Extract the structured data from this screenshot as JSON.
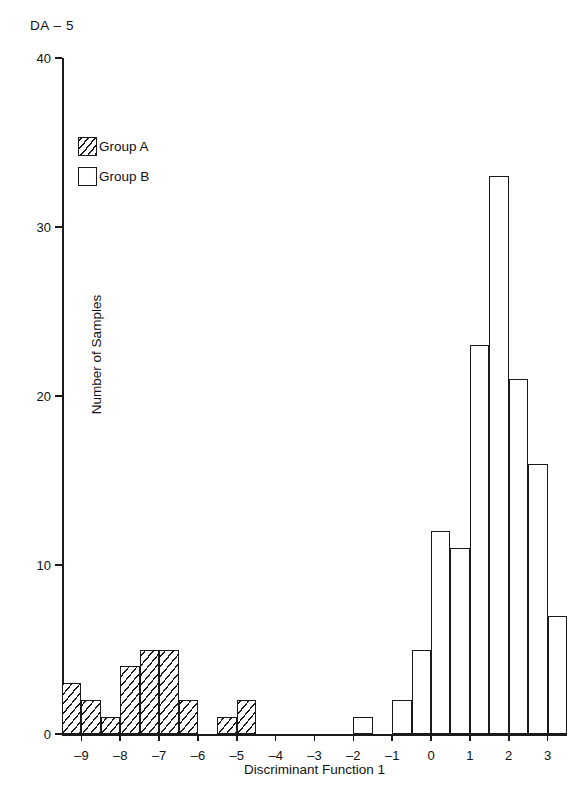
{
  "figure": {
    "id_label": "DA – 5"
  },
  "legend": {
    "position": "upper-left-inside",
    "entries": [
      {
        "label": "Group A",
        "swatch": "hatched-square"
      },
      {
        "label": "Group B",
        "swatch": "open-square"
      }
    ]
  },
  "chart_data": {
    "type": "bar",
    "title": "",
    "subtitle": "DA – 5",
    "xlabel": "Discriminant Function 1",
    "ylabel": "Number of Samples",
    "xlim": [
      -9.5,
      3.5
    ],
    "ylim": [
      0,
      40
    ],
    "grid": false,
    "bin_width": 0.5,
    "xticks": [
      -9,
      -8,
      -7,
      -6,
      -5,
      -4,
      -3,
      -2,
      -1,
      0,
      1,
      2,
      3
    ],
    "xticklabels": [
      "–9",
      "–8",
      "–7",
      "–6",
      "–5",
      "–4",
      "–3",
      "–2",
      "–1",
      "0",
      "1",
      "2",
      "3"
    ],
    "yticks": [
      0,
      10,
      20,
      30,
      40
    ],
    "yticklabels": [
      "0",
      "10",
      "20",
      "30",
      "40"
    ],
    "legend_position": "upper left",
    "series": [
      {
        "name": "Group A",
        "fill": "hatched",
        "bins": [
          {
            "x_left": -9.5,
            "x_right": -9.0,
            "value": 3
          },
          {
            "x_left": -9.0,
            "x_right": -8.5,
            "value": 2
          },
          {
            "x_left": -8.5,
            "x_right": -8.0,
            "value": 1
          },
          {
            "x_left": -8.0,
            "x_right": -7.5,
            "value": 4
          },
          {
            "x_left": -7.5,
            "x_right": -7.0,
            "value": 5
          },
          {
            "x_left": -7.0,
            "x_right": -6.5,
            "value": 5
          },
          {
            "x_left": -6.5,
            "x_right": -6.0,
            "value": 2
          },
          {
            "x_left": -5.5,
            "x_right": -5.0,
            "value": 1
          },
          {
            "x_left": -5.0,
            "x_right": -4.5,
            "value": 2
          }
        ]
      },
      {
        "name": "Group B",
        "fill": "open",
        "bins": [
          {
            "x_left": -2.0,
            "x_right": -1.5,
            "value": 1
          },
          {
            "x_left": -1.0,
            "x_right": -0.5,
            "value": 2
          },
          {
            "x_left": -0.5,
            "x_right": 0.0,
            "value": 5
          },
          {
            "x_left": 0.0,
            "x_right": 0.5,
            "value": 12
          },
          {
            "x_left": 0.5,
            "x_right": 1.0,
            "value": 11
          },
          {
            "x_left": 1.0,
            "x_right": 1.5,
            "value": 23
          },
          {
            "x_left": 1.5,
            "x_right": 2.0,
            "value": 33
          },
          {
            "x_left": 2.0,
            "x_right": 2.5,
            "value": 21
          },
          {
            "x_left": 2.5,
            "x_right": 3.0,
            "value": 16
          },
          {
            "x_left": 3.0,
            "x_right": 3.5,
            "value": 7
          }
        ]
      }
    ]
  },
  "colors": {
    "ink": "#1a1a1a",
    "background": "#ffffff"
  }
}
